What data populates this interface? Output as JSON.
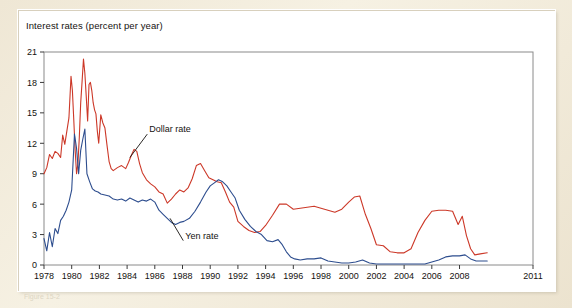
{
  "figure": {
    "title": "Interest rates (percent per year)",
    "footnote": "Figure 15-2"
  },
  "chart_data": {
    "type": "line",
    "title": "Interest rates (percent per year)",
    "xlabel": "",
    "ylabel": "Interest rates (percent per year)",
    "xlim": [
      1978,
      2011
    ],
    "ylim": [
      0,
      21
    ],
    "grid": false,
    "legend_position": "inline-annotations",
    "y_ticks": [
      0,
      3,
      6,
      9,
      12,
      15,
      18,
      21
    ],
    "x_ticks": [
      1978,
      1980,
      1982,
      1984,
      1986,
      1988,
      1990,
      1992,
      1994,
      1996,
      1998,
      2000,
      2002,
      2004,
      2006,
      2008,
      2011
    ],
    "annotations": [
      {
        "text": "Dollar rate",
        "x": 1985.6,
        "y": 13.1,
        "points_to_x": 1984.2,
        "points_to_y": 10.6
      },
      {
        "text": "Yen rate",
        "x": 1988.2,
        "y": 2.6,
        "points_to_x": 1987.1,
        "points_to_y": 4.6
      }
    ],
    "series": [
      {
        "name": "Dollar rate",
        "color": "#cc3828",
        "x": [
          1978.0,
          1978.2,
          1978.4,
          1978.6,
          1978.8,
          1979.0,
          1979.2,
          1979.35,
          1979.5,
          1979.65,
          1979.8,
          1979.95,
          1980.05,
          1980.15,
          1980.25,
          1980.35,
          1980.45,
          1980.55,
          1980.65,
          1980.75,
          1980.85,
          1980.95,
          1981.05,
          1981.15,
          1981.25,
          1981.35,
          1981.45,
          1981.55,
          1981.65,
          1981.75,
          1981.85,
          1981.95,
          1982.1,
          1982.25,
          1982.4,
          1982.55,
          1982.7,
          1982.85,
          1983.0,
          1983.3,
          1983.6,
          1983.9,
          1984.1,
          1984.3,
          1984.5,
          1984.7,
          1984.9,
          1985.1,
          1985.4,
          1985.7,
          1986.0,
          1986.3,
          1986.6,
          1986.9,
          1987.2,
          1987.5,
          1987.8,
          1988.1,
          1988.4,
          1988.7,
          1989.0,
          1989.3,
          1989.6,
          1989.9,
          1990.2,
          1990.5,
          1990.8,
          1991.1,
          1991.4,
          1991.7,
          1992.0,
          1992.4,
          1992.8,
          1993.2,
          1993.6,
          1994.0,
          1994.5,
          1995.0,
          1995.5,
          1996.0,
          1996.5,
          1997.0,
          1997.5,
          1998.0,
          1998.5,
          1999.0,
          1999.5,
          2000.0,
          2000.4,
          2000.8,
          2001.2,
          2001.6,
          2002.0,
          2002.5,
          2003.0,
          2003.5,
          2004.0,
          2004.5,
          2005.0,
          2005.5,
          2006.0,
          2006.5,
          2007.0,
          2007.5,
          2007.9,
          2008.2,
          2008.5,
          2008.8,
          2009.1,
          2009.5,
          2010.0
        ],
        "y": [
          9.0,
          9.6,
          10.9,
          10.5,
          11.2,
          11.0,
          10.6,
          12.8,
          11.9,
          13.2,
          14.5,
          18.6,
          17.2,
          14.3,
          11.3,
          9.0,
          10.0,
          12.6,
          16.0,
          18.1,
          20.3,
          18.9,
          16.6,
          14.2,
          17.8,
          18.0,
          17.2,
          16.0,
          15.3,
          14.9,
          13.2,
          12.0,
          14.8,
          14.0,
          13.5,
          11.8,
          10.2,
          9.5,
          9.3,
          9.6,
          9.8,
          9.5,
          10.1,
          10.8,
          11.4,
          11.2,
          10.0,
          9.1,
          8.4,
          8.0,
          7.7,
          7.2,
          7.0,
          6.1,
          6.5,
          7.0,
          7.4,
          7.2,
          7.6,
          8.5,
          9.8,
          10.0,
          9.3,
          8.6,
          8.4,
          8.2,
          8.1,
          7.2,
          6.2,
          5.7,
          4.3,
          3.8,
          3.4,
          3.2,
          3.3,
          3.9,
          4.9,
          6.0,
          6.0,
          5.5,
          5.6,
          5.7,
          5.8,
          5.6,
          5.4,
          5.2,
          5.5,
          6.2,
          6.7,
          6.8,
          5.0,
          3.6,
          2.0,
          1.9,
          1.3,
          1.2,
          1.2,
          1.6,
          3.2,
          4.4,
          5.3,
          5.4,
          5.4,
          5.3,
          4.0,
          4.8,
          2.9,
          1.6,
          1.0,
          1.1,
          1.2
        ],
        "label": "Dollar rate"
      },
      {
        "name": "Yen rate",
        "color": "#2d4d8e",
        "x": [
          1978.0,
          1978.2,
          1978.4,
          1978.6,
          1978.8,
          1979.0,
          1979.2,
          1979.4,
          1979.6,
          1979.8,
          1980.0,
          1980.2,
          1980.35,
          1980.5,
          1980.65,
          1980.8,
          1980.95,
          1981.1,
          1981.3,
          1981.5,
          1981.7,
          1981.9,
          1982.1,
          1982.4,
          1982.7,
          1983.0,
          1983.3,
          1983.6,
          1983.9,
          1984.2,
          1984.5,
          1984.8,
          1985.1,
          1985.4,
          1985.7,
          1986.0,
          1986.3,
          1986.6,
          1986.9,
          1987.2,
          1987.5,
          1987.8,
          1988.1,
          1988.5,
          1988.9,
          1989.3,
          1989.7,
          1990.0,
          1990.3,
          1990.6,
          1990.9,
          1991.2,
          1991.5,
          1991.8,
          1992.1,
          1992.5,
          1992.9,
          1993.3,
          1993.7,
          1994.1,
          1994.5,
          1994.9,
          1995.2,
          1995.5,
          1995.8,
          1996.1,
          1996.5,
          1997.0,
          1997.5,
          1998.0,
          1998.5,
          1999.0,
          1999.5,
          2000.0,
          2000.5,
          2001.0,
          2001.5,
          2002.0,
          2002.5,
          2003.0,
          2003.5,
          2004.0,
          2004.5,
          2005.0,
          2005.5,
          2006.0,
          2006.5,
          2007.0,
          2007.5,
          2008.0,
          2008.4,
          2008.8,
          2009.2,
          2009.6,
          2010.0
        ],
        "y": [
          2.6,
          1.4,
          3.2,
          1.8,
          3.6,
          3.1,
          4.4,
          4.8,
          5.4,
          6.2,
          7.4,
          12.9,
          11.5,
          9.0,
          11.3,
          12.4,
          13.4,
          9.0,
          8.2,
          7.5,
          7.3,
          7.2,
          7.0,
          6.9,
          6.8,
          6.5,
          6.4,
          6.5,
          6.3,
          6.6,
          6.4,
          6.2,
          6.4,
          6.3,
          6.5,
          6.2,
          5.4,
          5.0,
          4.6,
          4.2,
          4.0,
          4.2,
          4.3,
          4.6,
          5.3,
          6.2,
          7.2,
          7.8,
          8.1,
          8.4,
          8.2,
          7.8,
          7.2,
          6.6,
          5.4,
          4.5,
          3.8,
          3.3,
          3.0,
          2.4,
          2.3,
          2.5,
          2.0,
          1.3,
          0.8,
          0.6,
          0.5,
          0.6,
          0.6,
          0.7,
          0.4,
          0.3,
          0.2,
          0.2,
          0.3,
          0.5,
          0.2,
          0.1,
          0.1,
          0.1,
          0.1,
          0.1,
          0.1,
          0.1,
          0.1,
          0.3,
          0.5,
          0.8,
          0.9,
          0.9,
          1.0,
          0.6,
          0.4,
          0.4,
          0.4
        ],
        "label": "Yen rate"
      }
    ]
  }
}
